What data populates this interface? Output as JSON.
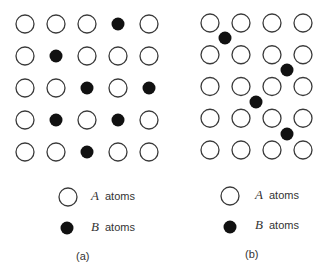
{
  "panels": [
    {
      "id": "a",
      "caption": "(a)",
      "description": "Substitutional solid solution: B atoms replace A atoms on lattice sites",
      "grid": {
        "rows": 5,
        "cols": 5,
        "origin": [
          25,
          24
        ],
        "spacing": [
          31,
          32
        ],
        "sites": [
          [
            "A",
            "A",
            "A",
            "B",
            "A"
          ],
          [
            "A",
            "B",
            "A",
            "A",
            "A"
          ],
          [
            "A",
            "A",
            "B",
            "A",
            "B"
          ],
          [
            "A",
            "B",
            "A",
            "B",
            "A"
          ],
          [
            "A",
            "A",
            "B",
            "A",
            "A"
          ]
        ]
      },
      "legend": [
        {
          "symbol": "A",
          "label": "atoms",
          "marker": "open-circle"
        },
        {
          "symbol": "B",
          "label": "atoms",
          "marker": "filled-circle"
        }
      ]
    },
    {
      "id": "b",
      "caption": "(b)",
      "description": "Interstitial solid solution: B atoms occupy interstitial positions between A atoms",
      "grid": {
        "rows": 5,
        "cols": 4,
        "origin": [
          210,
          23
        ],
        "spacing": [
          31,
          31.75
        ],
        "sites": [
          [
            "A",
            "A",
            "A",
            "A"
          ],
          [
            "A",
            "A",
            "A",
            "A"
          ],
          [
            "A",
            "A",
            "A",
            "A"
          ],
          [
            "A",
            "A",
            "A",
            "A"
          ],
          [
            "A",
            "A",
            "A",
            "A"
          ]
        ],
        "interstitials": [
          [
            225,
            38
          ],
          [
            287,
            70
          ],
          [
            256,
            102
          ],
          [
            287,
            134
          ]
        ]
      },
      "legend": [
        {
          "symbol": "A",
          "label": "atoms",
          "marker": "open-circle"
        },
        {
          "symbol": "B",
          "label": "atoms",
          "marker": "filled-circle"
        }
      ]
    }
  ],
  "style": {
    "stroke": "#3a3a3a",
    "fill_b": "#111111",
    "radius": 9
  }
}
